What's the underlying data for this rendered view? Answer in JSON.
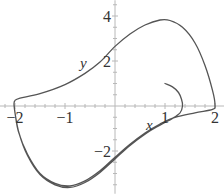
{
  "chart_data": {
    "type": "line",
    "title": "",
    "xlabel": "x",
    "ylabel": "y",
    "xlim": [
      -2.3,
      2.2
    ],
    "ylim": [
      -3.9,
      4.7
    ],
    "grid": false,
    "legend": null,
    "x_ticks": [
      {
        "value": -2,
        "label": "−2"
      },
      {
        "value": -1,
        "label": "−1"
      },
      {
        "value": 1,
        "label": "1"
      },
      {
        "value": 2,
        "label": "2"
      }
    ],
    "y_ticks": [
      {
        "value": 4,
        "label": "4"
      },
      {
        "value": 2,
        "label": "2"
      },
      {
        "value": -2,
        "label": "−2"
      }
    ],
    "series": [
      {
        "name": "trajectory",
        "color": "#555555",
        "points": [
          [
            1.0,
            1.0
          ],
          [
            1.15,
            0.85
          ],
          [
            1.27,
            0.6
          ],
          [
            1.33,
            0.3
          ],
          [
            1.35,
            0.0
          ],
          [
            1.3,
            -0.3
          ],
          [
            1.15,
            -0.55
          ],
          [
            0.9,
            -0.85
          ],
          [
            0.6,
            -1.25
          ],
          [
            0.3,
            -1.75
          ],
          [
            0.0,
            -2.35
          ],
          [
            -0.3,
            -2.95
          ],
          [
            -0.6,
            -3.4
          ],
          [
            -0.9,
            -3.62
          ],
          [
            -1.2,
            -3.5
          ],
          [
            -1.5,
            -3.05
          ],
          [
            -1.75,
            -2.2
          ],
          [
            -1.92,
            -1.2
          ],
          [
            -2.0,
            -0.3
          ],
          [
            -2.02,
            0.1
          ],
          [
            -2.0,
            0.25
          ],
          [
            -1.9,
            0.35
          ],
          [
            -1.5,
            0.55
          ],
          [
            -1.0,
            0.95
          ],
          [
            -0.6,
            1.45
          ],
          [
            -0.3,
            1.95
          ],
          [
            0.0,
            2.65
          ],
          [
            0.3,
            3.2
          ],
          [
            0.6,
            3.6
          ],
          [
            0.9,
            3.82
          ],
          [
            1.1,
            3.8
          ],
          [
            1.35,
            3.5
          ],
          [
            1.6,
            2.8
          ],
          [
            1.8,
            1.8
          ],
          [
            1.95,
            0.7
          ],
          [
            2.0,
            0.05
          ],
          [
            1.95,
            -0.15
          ],
          [
            1.6,
            -0.3
          ],
          [
            1.2,
            -0.5
          ],
          [
            0.9,
            -0.8
          ],
          [
            0.6,
            -1.2
          ],
          [
            0.3,
            -1.7
          ],
          [
            0.0,
            -2.28
          ],
          [
            -0.3,
            -2.88
          ],
          [
            -0.6,
            -3.33
          ],
          [
            -0.9,
            -3.55
          ],
          [
            -1.2,
            -3.44
          ],
          [
            -1.5,
            -3.0
          ],
          [
            -1.75,
            -2.15
          ],
          [
            -1.93,
            -1.15
          ],
          [
            -2.0,
            -0.3
          ],
          [
            -2.02,
            0.1
          ]
        ]
      }
    ]
  }
}
